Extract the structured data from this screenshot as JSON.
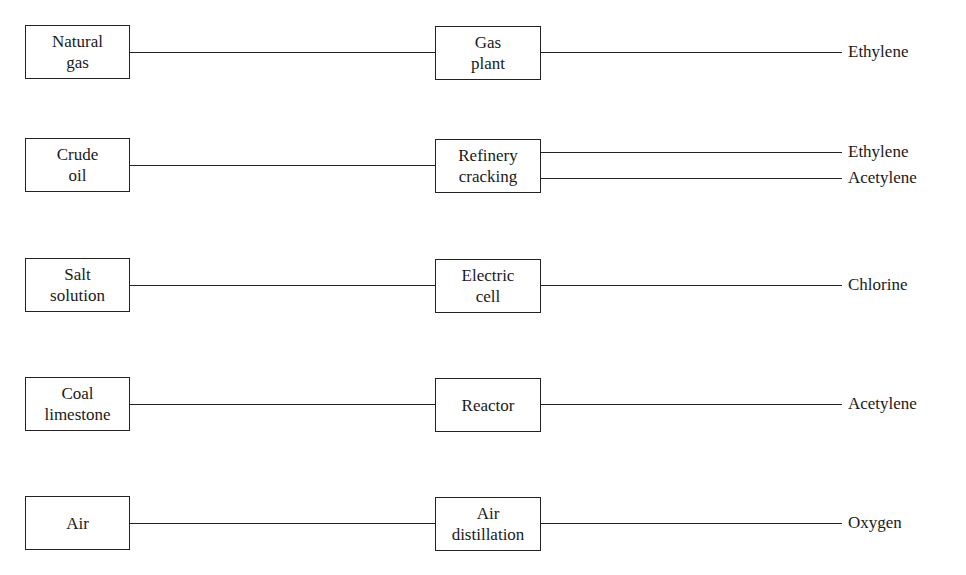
{
  "rows": [
    {
      "source": "Natural\ngas",
      "process": "Gas\nplant",
      "outputs": [
        "Ethylene"
      ]
    },
    {
      "source": "Crude\noil",
      "process": "Refinery\ncracking",
      "outputs": [
        "Ethylene",
        "Acetylene"
      ]
    },
    {
      "source": "Salt\nsolution",
      "process": "Electric\ncell",
      "outputs": [
        "Chlorine"
      ]
    },
    {
      "source": "Coal\nlimestone",
      "process": "Reactor",
      "outputs": [
        "Acetylene"
      ]
    },
    {
      "source": "Air",
      "process": "Air\ndistillation",
      "outputs": [
        "Oxygen"
      ]
    }
  ]
}
